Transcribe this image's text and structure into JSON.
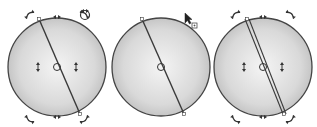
{
  "diagram": {
    "colors": {
      "background": "#ffffff",
      "sphere_edge": "#444444",
      "sphere_light": "#f2f2f2",
      "sphere_dark": "#b8b8b8",
      "line": "#3a3a3a",
      "handle": "#333333"
    },
    "panels": [
      {
        "id": "rotate-mode",
        "cx": 57,
        "cy": 67,
        "r": 49,
        "line": {
          "x1": 39,
          "y1": 19,
          "x2": 80,
          "y2": 114,
          "double": false
        },
        "rotate_handles": true,
        "skew_handles": true,
        "tool_icon": "rotate-tool-icon",
        "cursor": false
      },
      {
        "id": "dragging",
        "cx": 161,
        "cy": 67,
        "r": 49,
        "line": {
          "x1": 142,
          "y1": 19,
          "x2": 184,
          "y2": 114,
          "double": false
        },
        "rotate_handles": false,
        "skew_handles": false,
        "tool_icon": null,
        "cursor": true
      },
      {
        "id": "result",
        "cx": 263,
        "cy": 67,
        "r": 49,
        "line": {
          "x1": 247,
          "y1": 19,
          "x2": 284,
          "y2": 114,
          "double": true
        },
        "rotate_handles": true,
        "skew_handles": true,
        "tool_icon": null,
        "cursor": false
      }
    ]
  }
}
